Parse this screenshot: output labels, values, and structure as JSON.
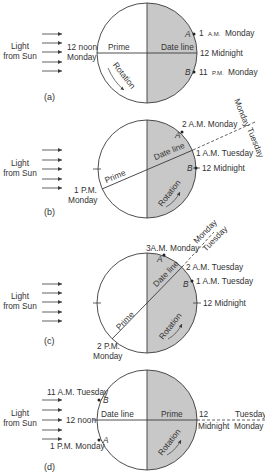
{
  "colors": {
    "night": "#c8c8c8",
    "day": "#ffffff",
    "stroke": "#3a3a3a",
    "text": "#333333"
  },
  "panels": [
    {
      "id": "a",
      "label": "(a)",
      "light_label_1": "Light",
      "light_label_2": "from Sun",
      "prime_label": "Prime",
      "date_line_label": "Date line",
      "rotation_label": "Rotation",
      "left_label_1": "12 noon",
      "left_label_2": "Monday",
      "right_label": "12 Midnight",
      "point_a": {
        "name": "A",
        "time": "1",
        "ampm": "A.M.",
        "day": "Monday"
      },
      "point_b": {
        "name": "B",
        "time": "11",
        "ampm": "P.M.",
        "day": "Monday"
      }
    },
    {
      "id": "b",
      "label": "(b)",
      "light_label_1": "Light",
      "light_label_2": "from Sun",
      "prime_label": "Prime",
      "date_line_label": "Date line",
      "rotation_label": "Rotation",
      "prime_time_1": "1 P.M.",
      "prime_time_2": "Monday",
      "dateline_time": "1 A.M. Tuesday",
      "point_a": {
        "name": "A",
        "label": "2 A.M. Monday"
      },
      "point_b": {
        "name": "B",
        "label": "12 Midnight"
      },
      "side_west": "Monday",
      "side_east": "Tuesday"
    },
    {
      "id": "c",
      "label": "(c)",
      "light_label_1": "Light",
      "light_label_2": "from Sun",
      "prime_label": "Prime",
      "date_line_label": "Date line",
      "rotation_label": "Rotation",
      "prime_time_1": "2 P.M.",
      "prime_time_2": "Monday",
      "dateline_time": "2 A.M. Tuesday",
      "point_a": {
        "name": "A",
        "label": "3A.M. Monday"
      },
      "point_b": {
        "name": "B",
        "label": "1 A.M. Tuesday"
      },
      "right_label": "12 Midnight",
      "side_west": "Monday",
      "side_east": "Tuesday"
    },
    {
      "id": "d",
      "label": "(d)",
      "light_label_1": "Light",
      "light_label_2": "from Sun",
      "prime_label": "Prime",
      "date_line_label": "Date line",
      "rotation_label": "Rotation",
      "left_label": "12 noon",
      "right_label_1": "12",
      "right_label_2": "Midnight",
      "point_a": {
        "name": "A",
        "label": "1 P.M. Monday"
      },
      "point_b": {
        "name": "B",
        "label": "11 A.M. Tuesday"
      },
      "side_north": "Tuesday",
      "side_south": "Monday"
    }
  ]
}
